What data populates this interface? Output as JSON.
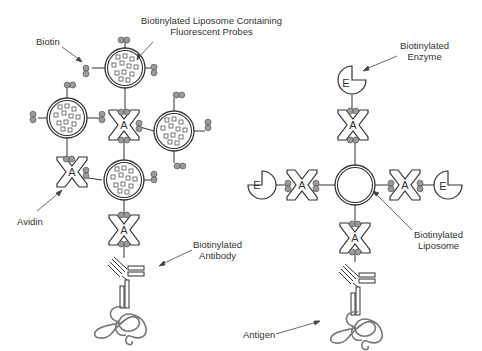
{
  "diagram": {
    "left_panel": {
      "labels": {
        "biotin": "Biotin",
        "liposome_line1": "Biotinylated Liposome Containing",
        "liposome_line2": "Fluorescent Probes",
        "avidin": "Avidin",
        "antibody_line1": "Biotinylated",
        "antibody_line2": "Antibody"
      },
      "liposomes_with_probes": 4,
      "avidin_count": 3
    },
    "right_panel": {
      "labels": {
        "enzyme_line1": "Biotinylated",
        "enzyme_line2": "Enzyme",
        "liposome_line1": "Biotinylated",
        "liposome_line2": "Liposome",
        "antigen": "Antigen"
      },
      "enzyme_count": 3,
      "avidin_count": 4
    },
    "glyphs": {
      "avidin": "A",
      "enzyme": "E"
    },
    "colors": {
      "line": "#333333",
      "biotin_fill": "#9a9a9a",
      "background": "#ffffff"
    }
  }
}
